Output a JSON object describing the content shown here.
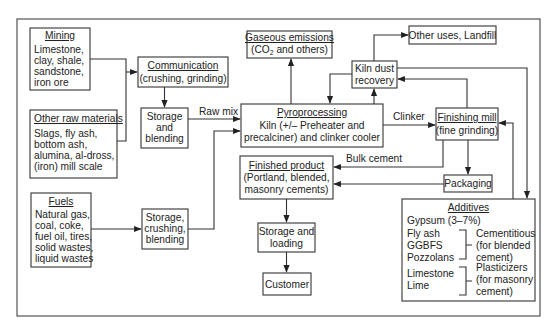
{
  "diagram": {
    "colors": {
      "background": "#ffffff",
      "stroke": "#333333",
      "text": "#222222"
    },
    "nodes": {
      "mining": {
        "title": "Mining",
        "lines": [
          "Limestone,",
          "clay, shale,",
          "sandstone,",
          "iron ore"
        ]
      },
      "other_raw": {
        "title": "Other raw materials",
        "lines": [
          "Slags, fly ash,",
          "bottom ash,",
          "alumina, al-dross,",
          "(iron) mill scale"
        ]
      },
      "fuels": {
        "title": "Fuels",
        "lines": [
          "Natural gas,",
          "coal, coke,",
          "fuel oil, tires,",
          "solid wastes,",
          "liquid wastes"
        ]
      },
      "communication": {
        "title": "Communication",
        "lines": [
          "(crushing, grinding)"
        ]
      },
      "storage_blending": {
        "lines": [
          "Storage",
          "and",
          "blending"
        ]
      },
      "storage_crushing": {
        "lines": [
          "Storage,",
          "crushing,",
          "blending"
        ]
      },
      "gaseous": {
        "title": "Gaseous emissions",
        "line_pre": "(CO",
        "line_sub": "2",
        "line_post": " and others)"
      },
      "pyro": {
        "title": "Pyroprocessing",
        "lines": [
          "Kiln (+/– Preheater and",
          "precalciner) and clinker cooler"
        ]
      },
      "kiln_dust": {
        "lines": [
          "Kiln dust",
          "recovery"
        ]
      },
      "other_uses": {
        "lines": [
          "Other uses, Landfill"
        ]
      },
      "finishing": {
        "title": "Finishing mill",
        "lines": [
          "(fine grinding)"
        ]
      },
      "finished": {
        "title": "Finished product",
        "lines": [
          "(Portland, blended,",
          "masonry cements)"
        ]
      },
      "packaging": {
        "lines": [
          "Packaging"
        ]
      },
      "storage_loading": {
        "lines": [
          "Storage and",
          "loading"
        ]
      },
      "customer": {
        "lines": [
          "Customer"
        ]
      },
      "additives": {
        "title": "Additives",
        "gypsum": "Gypsum (3–7%)",
        "group1_items": [
          "Fly ash",
          "GGBFS",
          "Pozzolans"
        ],
        "group1_desc": [
          "Cementitious",
          "(for blended",
          "cement)"
        ],
        "group2_items": [
          "Limestone",
          "Lime"
        ],
        "group2_desc": [
          "Plasticizers",
          "(for masonry",
          "cement)"
        ]
      }
    },
    "edge_labels": {
      "raw_mix": "Raw mix",
      "clinker": "Clinker",
      "bulk_cement": "Bulk cement"
    }
  }
}
